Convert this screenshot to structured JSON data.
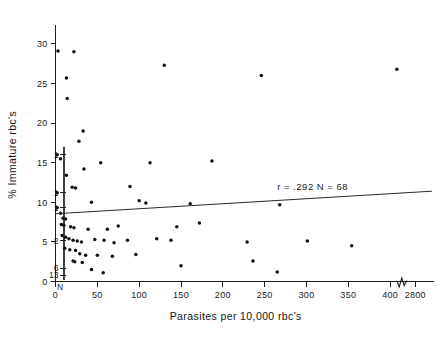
{
  "chart_data": {
    "type": "scatter",
    "title": "",
    "xlabel": "Parasites per 10,000 rbc's",
    "ylabel": "% Immature rbc's",
    "xlim": [
      0,
      450
    ],
    "ylim": [
      0,
      32
    ],
    "grid": false,
    "legend_position": "none",
    "xticks": [
      "0",
      "50",
      "100",
      "150",
      "200",
      "250",
      "300",
      "350",
      "400",
      "2800"
    ],
    "xtick_values": [
      0,
      50,
      100,
      150,
      200,
      250,
      300,
      350,
      400,
      430
    ],
    "yticks": [
      "0",
      "5",
      "10",
      "15",
      "20",
      "25",
      "30"
    ],
    "ytick_values": [
      0,
      5,
      10,
      15,
      20,
      25,
      30
    ],
    "axis_break": {
      "present": true,
      "between": [
        "400",
        "2800"
      ],
      "position_value": 415
    },
    "annotations": [
      {
        "text": "r = .292   N = 68",
        "x": 265,
        "y": 11.6
      }
    ],
    "statistics": {
      "r": ".292",
      "N": "68",
      "r_label": "r = .292",
      "n_label": "N = 68"
    },
    "regression_line": {
      "x_start": 0,
      "y_start": 8.55,
      "x_end": 450,
      "y_end": 11.4
    },
    "marginal_counts": {
      "axis_label": "N",
      "description": "counts of overlapping points at x near 0",
      "entries": [
        {
          "label": "1",
          "y": 16.0
        },
        {
          "label": "1",
          "y": 11.2
        },
        {
          "label": "1",
          "y": 9.3
        },
        {
          "label": "2",
          "y": 5.2
        },
        {
          "label": "6",
          "y": 1.7
        },
        {
          "label": "13",
          "y": 0.8
        }
      ]
    },
    "points": [
      {
        "x": 3,
        "y": 29.1
      },
      {
        "x": 22,
        "y": 29.0
      },
      {
        "x": 130,
        "y": 27.3
      },
      {
        "x": 246,
        "y": 26.0
      },
      {
        "x": 408,
        "y": 26.8
      },
      {
        "x": 13,
        "y": 25.7
      },
      {
        "x": 14,
        "y": 23.1
      },
      {
        "x": 33,
        "y": 19.0
      },
      {
        "x": 28,
        "y": 17.7
      },
      {
        "x": 2,
        "y": 16.0
      },
      {
        "x": 6,
        "y": 15.5
      },
      {
        "x": 54,
        "y": 15.0
      },
      {
        "x": 113,
        "y": 15.0
      },
      {
        "x": 187,
        "y": 15.2
      },
      {
        "x": 13,
        "y": 13.4
      },
      {
        "x": 34,
        "y": 14.2
      },
      {
        "x": 20,
        "y": 11.9
      },
      {
        "x": 24,
        "y": 11.8
      },
      {
        "x": 2,
        "y": 11.2
      },
      {
        "x": 89,
        "y": 12.0
      },
      {
        "x": 2,
        "y": 9.3
      },
      {
        "x": 43,
        "y": 10.0
      },
      {
        "x": 100,
        "y": 10.2
      },
      {
        "x": 108,
        "y": 9.9
      },
      {
        "x": 161,
        "y": 9.8
      },
      {
        "x": 6,
        "y": 8.6
      },
      {
        "x": 9,
        "y": 8.0
      },
      {
        "x": 12,
        "y": 7.9
      },
      {
        "x": 268,
        "y": 9.7
      },
      {
        "x": 7,
        "y": 7.2
      },
      {
        "x": 10,
        "y": 7.1
      },
      {
        "x": 18,
        "y": 6.9
      },
      {
        "x": 22,
        "y": 6.8
      },
      {
        "x": 39,
        "y": 6.6
      },
      {
        "x": 62,
        "y": 6.6
      },
      {
        "x": 75,
        "y": 7.0
      },
      {
        "x": 145,
        "y": 6.9
      },
      {
        "x": 172,
        "y": 7.4
      },
      {
        "x": 8,
        "y": 5.8
      },
      {
        "x": 12,
        "y": 5.6
      },
      {
        "x": 16,
        "y": 5.4
      },
      {
        "x": 21,
        "y": 5.2
      },
      {
        "x": 26,
        "y": 5.1
      },
      {
        "x": 31,
        "y": 5.0
      },
      {
        "x": 47,
        "y": 5.3
      },
      {
        "x": 58,
        "y": 5.2
      },
      {
        "x": 70,
        "y": 4.9
      },
      {
        "x": 86,
        "y": 5.2
      },
      {
        "x": 121,
        "y": 5.4
      },
      {
        "x": 138,
        "y": 5.2
      },
      {
        "x": 229,
        "y": 5.0
      },
      {
        "x": 301,
        "y": 5.1
      },
      {
        "x": 354,
        "y": 4.5
      },
      {
        "x": 11,
        "y": 4.2
      },
      {
        "x": 17,
        "y": 4.0
      },
      {
        "x": 24,
        "y": 3.9
      },
      {
        "x": 29,
        "y": 3.5
      },
      {
        "x": 36,
        "y": 3.3
      },
      {
        "x": 50,
        "y": 3.3
      },
      {
        "x": 68,
        "y": 3.2
      },
      {
        "x": 96,
        "y": 3.4
      },
      {
        "x": 21,
        "y": 2.6
      },
      {
        "x": 23,
        "y": 2.5
      },
      {
        "x": 32,
        "y": 2.4
      },
      {
        "x": 150,
        "y": 2.0
      },
      {
        "x": 236,
        "y": 2.6
      },
      {
        "x": 43,
        "y": 1.5
      },
      {
        "x": 57,
        "y": 1.1
      },
      {
        "x": 265,
        "y": 1.2
      }
    ]
  }
}
